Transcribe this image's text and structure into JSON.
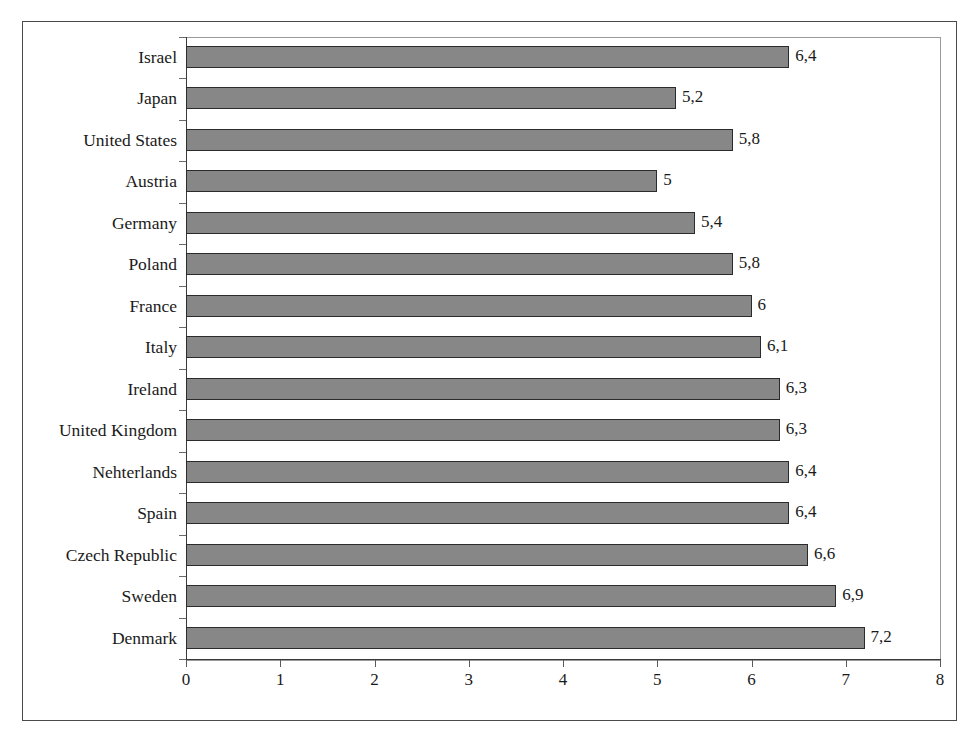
{
  "chart_data": {
    "type": "bar",
    "orientation": "horizontal",
    "title": "",
    "subtitle": "",
    "xlabel": "",
    "ylabel": "",
    "xlim": [
      0,
      8
    ],
    "grid": false,
    "legend": false,
    "decimal_separator": ",",
    "categories": [
      "Israel",
      "Japan",
      "United States",
      "Austria",
      "Germany",
      "Poland",
      "France",
      "Italy",
      "Ireland",
      "United Kingdom",
      "Nehterlands",
      "Spain",
      "Czech Republic",
      "Sweden",
      "Denmark"
    ],
    "values": [
      6.4,
      5.2,
      5.8,
      5.0,
      5.4,
      5.8,
      6.0,
      6.1,
      6.3,
      6.3,
      6.4,
      6.4,
      6.6,
      6.9,
      7.2
    ],
    "data_labels": [
      "6,4",
      "5,2",
      "5,8",
      "5",
      "5,4",
      "5,8",
      "6",
      "6,1",
      "6,3",
      "6,3",
      "6,4",
      "6,4",
      "6,6",
      "6,9",
      "7,2"
    ],
    "xticks": [
      0,
      1,
      2,
      3,
      4,
      5,
      6,
      7,
      8
    ],
    "xtick_labels": [
      "0",
      "1",
      "2",
      "3",
      "4",
      "5",
      "6",
      "7",
      "8"
    ],
    "series": [
      {
        "name": "",
        "values": [
          6.4,
          5.2,
          5.8,
          5.0,
          5.4,
          5.8,
          6.0,
          6.1,
          6.3,
          6.3,
          6.4,
          6.4,
          6.6,
          6.9,
          7.2
        ],
        "bar_fill_color": "#878787",
        "bar_border_color": "#2b2b2b"
      }
    ],
    "colors": {
      "bar_fill": "#878787",
      "bar_border": "#2b2b2b",
      "axis": "#3a3a3a",
      "plot_border": "#9a9a9a",
      "frame_border": "#4a4a4a",
      "text": "#1a1a1a",
      "background": "#ffffff"
    }
  }
}
